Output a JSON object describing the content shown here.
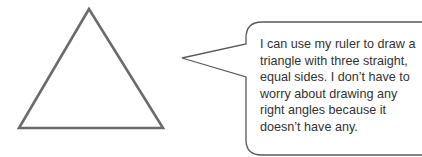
{
  "figure": {
    "shape": "equilateral-triangle",
    "stroke_color": "#6b6b6b",
    "fill_color": "#ffffff"
  },
  "callout": {
    "stroke_color": "#5a5a5a",
    "lines": [
      "I can use my ruler to draw a",
      "triangle with three straight,",
      "equal sides.  I don’t have to",
      "worry about drawing any",
      "right angles because it",
      "doesn’t have any."
    ]
  }
}
